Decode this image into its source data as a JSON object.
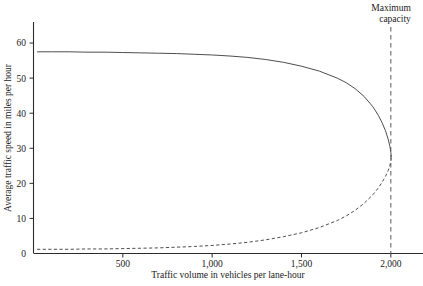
{
  "chart_data": {
    "type": "line",
    "title": "",
    "xlabel": "Traffic volume in vehicles per lane-hour",
    "ylabel": "Average traffic speed in miles per hour",
    "xlim": [
      0,
      2180
    ],
    "ylim": [
      0,
      66
    ],
    "grid": false,
    "legend_position": "none",
    "x_ticks": [
      500,
      1000,
      1500,
      2000
    ],
    "x_tick_labels": [
      "500",
      "1,000",
      "1,500",
      "2,000"
    ],
    "y_ticks": [
      0,
      10,
      20,
      30,
      40,
      50,
      60
    ],
    "y_tick_labels": [
      "0",
      "10",
      "20",
      "30",
      "40",
      "50",
      "60"
    ],
    "annotations": [
      {
        "name": "maximum-capacity",
        "text_line1": "Maximum",
        "text_line2": "capacity",
        "x": 2000,
        "style": "vertical-dashed-line"
      }
    ],
    "series": [
      {
        "name": "free-flow-branch",
        "style": "solid",
        "points": [
          [
            20,
            57.5
          ],
          [
            100,
            57.5
          ],
          [
            200,
            57.5
          ],
          [
            300,
            57.4
          ],
          [
            400,
            57.4
          ],
          [
            500,
            57.3
          ],
          [
            600,
            57.2
          ],
          [
            700,
            57.1
          ],
          [
            800,
            57.0
          ],
          [
            900,
            56.8
          ],
          [
            1000,
            56.6
          ],
          [
            1100,
            56.3
          ],
          [
            1200,
            55.9
          ],
          [
            1300,
            55.3
          ],
          [
            1400,
            54.5
          ],
          [
            1500,
            53.4
          ],
          [
            1600,
            52.0
          ],
          [
            1700,
            50.0
          ],
          [
            1750,
            48.7
          ],
          [
            1800,
            47.0
          ],
          [
            1850,
            44.8
          ],
          [
            1900,
            41.8
          ],
          [
            1930,
            39.4
          ],
          [
            1950,
            37.4
          ],
          [
            1970,
            35.0
          ],
          [
            1985,
            32.6
          ],
          [
            1995,
            30.5
          ],
          [
            2000,
            28.8
          ],
          [
            2003,
            27.5
          ]
        ]
      },
      {
        "name": "congested-branch",
        "style": "dashed",
        "points": [
          [
            20,
            1.2
          ],
          [
            100,
            1.2
          ],
          [
            200,
            1.2
          ],
          [
            300,
            1.3
          ],
          [
            400,
            1.3
          ],
          [
            500,
            1.4
          ],
          [
            600,
            1.5
          ],
          [
            700,
            1.6
          ],
          [
            800,
            1.8
          ],
          [
            900,
            2.0
          ],
          [
            1000,
            2.3
          ],
          [
            1100,
            2.7
          ],
          [
            1200,
            3.2
          ],
          [
            1300,
            3.9
          ],
          [
            1400,
            4.8
          ],
          [
            1500,
            5.9
          ],
          [
            1600,
            7.4
          ],
          [
            1700,
            9.4
          ],
          [
            1750,
            10.7
          ],
          [
            1800,
            12.3
          ],
          [
            1850,
            14.3
          ],
          [
            1900,
            16.8
          ],
          [
            1930,
            18.7
          ],
          [
            1950,
            20.2
          ],
          [
            1970,
            22.0
          ],
          [
            1985,
            23.6
          ],
          [
            1995,
            25.2
          ],
          [
            2000,
            26.2
          ],
          [
            2003,
            27.5
          ]
        ]
      }
    ]
  }
}
